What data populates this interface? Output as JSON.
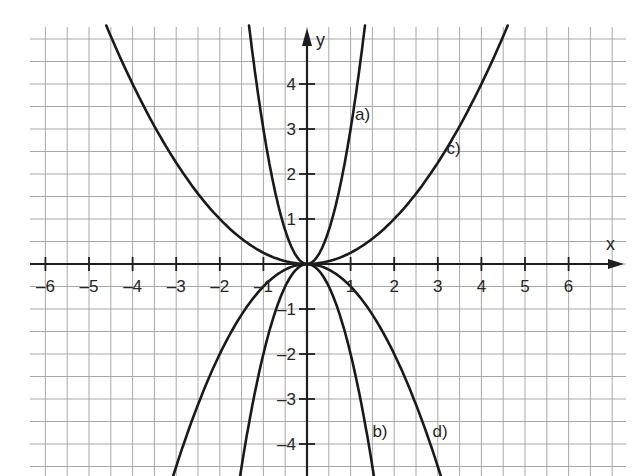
{
  "chart_data": {
    "type": "line",
    "title": "",
    "xlabel": "x",
    "ylabel": "y",
    "xlim": [
      -6.5,
      7.2
    ],
    "ylim": [
      -4.7,
      5.3
    ],
    "grid": true,
    "grid_step": 0.5,
    "legend": "none (inline curve labels)",
    "x_ticks": [
      -6,
      -5,
      -4,
      -3,
      -2,
      -1,
      1,
      2,
      3,
      4,
      5,
      6
    ],
    "y_ticks": [
      -4,
      -3,
      -2,
      -1,
      1,
      2,
      3,
      4
    ],
    "x_tick_labels": [
      "-6",
      "-5",
      "-4",
      "-3",
      "-2",
      "-1",
      "1",
      "2",
      "3",
      "4",
      "5",
      "6"
    ],
    "y_tick_labels": [
      "-4",
      "-3",
      "-2",
      "-1",
      "1",
      "2",
      "3",
      "4"
    ],
    "series": [
      {
        "name": "a)",
        "formula": "y = 3x^2",
        "coefficient": 3,
        "x": [
          -1.33,
          -1,
          -0.5,
          0,
          0.5,
          1,
          1.33
        ],
        "values": [
          5.3,
          3,
          0.75,
          0,
          0.75,
          3,
          5.3
        ],
        "label_pos": {
          "x": 1.1,
          "y": 3.2
        }
      },
      {
        "name": "b)",
        "formula": "y = -2x^2",
        "coefficient": -2,
        "x": [
          -1.53,
          -1,
          -0.5,
          0,
          0.5,
          1,
          1.53
        ],
        "values": [
          -4.7,
          -2,
          -0.5,
          0,
          -0.5,
          -2,
          -4.7
        ],
        "label_pos": {
          "x": 1.5,
          "y": -3.85
        }
      },
      {
        "name": "c)",
        "formula": "y = 0.25x^2",
        "coefficient": 0.25,
        "x": [
          -4.6,
          -4,
          -2,
          0,
          2,
          4,
          4.6
        ],
        "values": [
          5.3,
          4,
          1,
          0,
          1,
          4,
          5.3
        ],
        "label_pos": {
          "x": 3.2,
          "y": 2.45
        }
      },
      {
        "name": "d)",
        "formula": "y = -0.5x^2",
        "coefficient": -0.5,
        "x": [
          -3.07,
          -2,
          -1,
          0,
          1,
          2,
          3.07
        ],
        "values": [
          -4.7,
          -2,
          -0.5,
          0,
          -0.5,
          -2,
          -4.7
        ],
        "label_pos": {
          "x": 2.88,
          "y": -3.85
        }
      }
    ]
  },
  "layout": {
    "origin_px": {
      "x": 307,
      "y": 264
    },
    "unit_px": {
      "x": 43.6,
      "y": 45
    },
    "grid_bounds_px": {
      "left": 30,
      "right": 626,
      "top": 37,
      "bottom": 476
    },
    "colors": {
      "grid": "#a8a8a8",
      "axis": "#1e1e1e",
      "curve": "#1a1a1a",
      "text": "#262626",
      "background": "#ffffff"
    }
  }
}
